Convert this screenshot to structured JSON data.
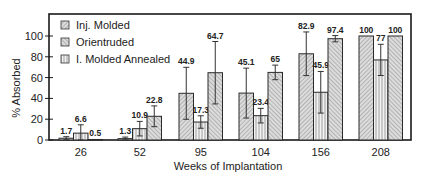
{
  "chart_data": {
    "type": "bar",
    "title": "",
    "xlabel": "Weeks of Implantation",
    "ylabel": "% Absorbed",
    "ylim": [
      0,
      117
    ],
    "yticks": [
      0,
      20,
      40,
      60,
      80,
      100
    ],
    "grid": false,
    "legend_position": "upper-left",
    "categories": [
      "26",
      "52",
      "95",
      "104",
      "156",
      "208"
    ],
    "series": [
      {
        "name": "Inj. Molded",
        "pattern": "diagonal-dense",
        "values": [
          1.7,
          1.3,
          44.9,
          45.1,
          82.9,
          100
        ],
        "errors": [
          1.5,
          1.5,
          25,
          24,
          21,
          0
        ],
        "labels": [
          "1.7",
          "1.3",
          "44.9",
          "45.1",
          "82.9",
          "100"
        ]
      },
      {
        "name": "Orientruded",
        "pattern": "vertical-lines",
        "values": [
          6.6,
          10.9,
          17.3,
          23.4,
          45.9,
          77
        ],
        "errors": [
          8,
          7,
          6,
          7,
          20,
          15
        ],
        "labels": [
          "6.6",
          "10.9",
          "17.3",
          "23.4",
          "45.9",
          "77"
        ]
      },
      {
        "name": "I. Molded Annealed",
        "pattern": "diagonal",
        "values": [
          0.5,
          22.8,
          64.7,
          65,
          97.4,
          100
        ],
        "errors": [
          0,
          10,
          30,
          7,
          3,
          0
        ],
        "labels": [
          "0.5",
          "22.8",
          "64.7",
          "65",
          "97.4",
          "100"
        ]
      }
    ]
  },
  "legend": {
    "items": [
      {
        "label": "Inj. Molded",
        "pattern": "diagonal-dense"
      },
      {
        "label": "Orientruded",
        "pattern": "diagonal"
      },
      {
        "label": "I. Molded Annealed",
        "pattern": "vertical-lines"
      }
    ]
  },
  "axes": {
    "x_title": "Weeks of Implantation",
    "y_title": "% Absorbed",
    "x_ticks": [
      "26",
      "52",
      "95",
      "104",
      "156",
      "208"
    ],
    "y_ticks": [
      "0",
      "20",
      "40",
      "60",
      "80",
      "100"
    ]
  },
  "colors": {
    "frame": "#1a1a1a",
    "bar_fill": "#d8d8d8",
    "hatch": "#7a7a7a"
  }
}
